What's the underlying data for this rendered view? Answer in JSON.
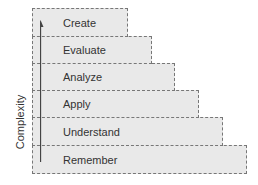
{
  "diagram": {
    "axis_label": "Complexity",
    "levels": [
      {
        "label": "Create",
        "top": 8,
        "height": 29,
        "width": 96
      },
      {
        "label": "Evaluate",
        "top": 36,
        "height": 28,
        "width": 120
      },
      {
        "label": "Analyze",
        "top": 63,
        "height": 28,
        "width": 143
      },
      {
        "label": "Apply",
        "top": 90,
        "height": 28,
        "width": 167
      },
      {
        "label": "Understand",
        "top": 117,
        "height": 29,
        "width": 191
      },
      {
        "label": "Remember",
        "top": 145,
        "height": 29,
        "width": 215
      }
    ],
    "colors": {
      "fill": "#e9e9e9",
      "border": "#777777",
      "text": "#333333"
    }
  }
}
